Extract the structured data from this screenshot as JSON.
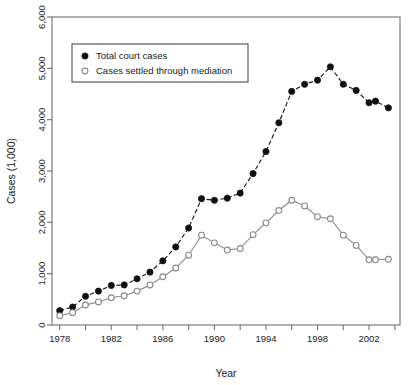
{
  "chart_data": {
    "type": "line",
    "title": "",
    "xlabel": "Year",
    "ylabel": "Cases (1,000)",
    "xlim": [
      1977.4,
      2004.4
    ],
    "ylim": [
      0,
      6000
    ],
    "grid": false,
    "legend_position": "upper-left-inside",
    "x_tick_labels": [
      "1978",
      "1982",
      "1986",
      "1990",
      "1994",
      "1998",
      "2002"
    ],
    "x_tick_values": [
      1978,
      1982,
      1986,
      1990,
      1994,
      1998,
      2002
    ],
    "x_minor_tick_values": [
      1980,
      1984,
      1988,
      1992,
      1996,
      2000,
      2004
    ],
    "y_tick_labels": [
      "0",
      "1,000",
      "2,000",
      "3,000",
      "4,000",
      "5,000",
      "6,000"
    ],
    "y_tick_values": [
      0,
      1000,
      2000,
      3000,
      4000,
      5000,
      6000
    ],
    "x": [
      1978,
      1978.5,
      1979,
      1979.5,
      1980,
      1980.5,
      1981,
      1981.5,
      1982,
      1982.5,
      1983,
      1983.5,
      1984,
      1984.5,
      1985,
      1985.5,
      1986,
      1986.5,
      1987,
      1987.5,
      1988,
      1988.5,
      1989,
      1989.5,
      1990,
      1990.5,
      1991,
      1991.5,
      1992,
      1992.5,
      1993,
      1993.5,
      1994,
      1994.5,
      1995,
      1995.5,
      1996,
      1996.5,
      1997,
      1997.5,
      1998,
      1998.5,
      1999,
      1999.5,
      2000,
      2000.5,
      2001,
      2001.5,
      2002,
      2002.5,
      2003,
      2003.5
    ],
    "series": [
      {
        "name": "Total court cases",
        "marker": "filled-circle",
        "linestyle": "dashed",
        "color": "#111111",
        "points": [
          [
            1978,
            280
          ],
          [
            1979,
            350
          ],
          [
            1980,
            560
          ],
          [
            1981,
            660
          ],
          [
            1982,
            770
          ],
          [
            1983,
            780
          ],
          [
            1984,
            900
          ],
          [
            1985,
            1030
          ],
          [
            1986,
            1250
          ],
          [
            1987,
            1520
          ],
          [
            1988,
            1890
          ],
          [
            1989,
            2460
          ],
          [
            1990,
            2430
          ],
          [
            1991,
            2470
          ],
          [
            1992,
            2570
          ],
          [
            1993,
            2950
          ],
          [
            1994,
            3380
          ],
          [
            1995,
            3940
          ],
          [
            1996,
            4550
          ],
          [
            1997,
            4690
          ],
          [
            1998,
            4770
          ],
          [
            1999,
            5030
          ],
          [
            2000,
            4690
          ],
          [
            2001,
            4570
          ],
          [
            2002,
            4330
          ],
          [
            2002.5,
            4360
          ],
          [
            2003.5,
            4230
          ]
        ]
      },
      {
        "name": "Cases settled through mediation",
        "marker": "open-circle",
        "linestyle": "solid",
        "color": "#8a8a8a",
        "points": [
          [
            1978,
            180
          ],
          [
            1979,
            240
          ],
          [
            1980,
            390
          ],
          [
            1981,
            450
          ],
          [
            1982,
            530
          ],
          [
            1983,
            570
          ],
          [
            1984,
            660
          ],
          [
            1985,
            780
          ],
          [
            1986,
            940
          ],
          [
            1987,
            1110
          ],
          [
            1988,
            1360
          ],
          [
            1989,
            1750
          ],
          [
            1990,
            1600
          ],
          [
            1991,
            1460
          ],
          [
            1992,
            1490
          ],
          [
            1993,
            1760
          ],
          [
            1994,
            1990
          ],
          [
            1995,
            2230
          ],
          [
            1996,
            2430
          ],
          [
            1997,
            2320
          ],
          [
            1998,
            2110
          ],
          [
            1999,
            2070
          ],
          [
            2000,
            1750
          ],
          [
            2001,
            1550
          ],
          [
            2002,
            1270
          ],
          [
            2002.5,
            1270
          ],
          [
            2003.5,
            1280
          ]
        ]
      }
    ]
  },
  "legend": {
    "items": [
      {
        "label": "Total court cases",
        "marker": "filled-circle"
      },
      {
        "label": "Cases settled through mediation",
        "marker": "open-circle"
      }
    ]
  },
  "axes": {
    "x_title": "Year",
    "y_title": "Cases (1,000)"
  }
}
